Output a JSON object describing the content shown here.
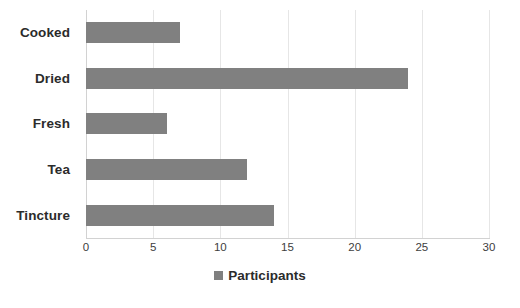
{
  "chart_data": {
    "type": "bar",
    "orientation": "horizontal",
    "title": "",
    "xlabel": "",
    "ylabel": "",
    "categories": [
      "Cooked",
      "Dried",
      "Fresh",
      "Tea",
      "Tincture"
    ],
    "values": [
      7,
      24,
      6,
      12,
      14
    ],
    "series": [
      {
        "name": "Participants",
        "values": [
          7,
          24,
          6,
          12,
          14
        ],
        "color": "#808080"
      }
    ],
    "xlim": [
      0,
      30
    ],
    "xticks": [
      0,
      5,
      10,
      15,
      20,
      25,
      30
    ],
    "xticklabels": [
      "0",
      "5",
      "10",
      "15",
      "20",
      "25",
      "30"
    ],
    "grid": "vertical",
    "legend": {
      "position": "bottom",
      "entries": [
        {
          "label": "Participants",
          "color": "#808080"
        }
      ]
    },
    "colors": {
      "bar": "#808080",
      "gridline": "#e6e6e6",
      "axis": "#d2d2d2",
      "text": "#2b2b2b",
      "tick_text": "#404040",
      "background": "#ffffff"
    }
  }
}
